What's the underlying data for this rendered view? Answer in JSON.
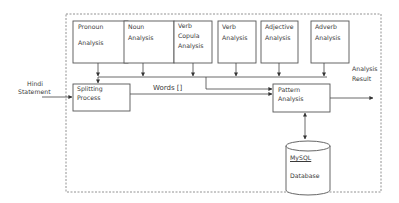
{
  "diagram": {
    "type": "block-flow",
    "container": {
      "style": "dashed",
      "label": ""
    },
    "input": {
      "label_line1": "Hindi",
      "label_line2": "Statement"
    },
    "output": {
      "label_line1": "Analysis",
      "label_line2": "Result"
    },
    "analysis_modules": [
      {
        "id": "pronoun",
        "line1": "Pronoun",
        "line2": "",
        "line3": "Analysis"
      },
      {
        "id": "noun",
        "line1": "Noun",
        "line2": "Analysis",
        "line3": ""
      },
      {
        "id": "verb_copula",
        "line1": "Verb",
        "line2": "Copula",
        "line3": "Analysis"
      },
      {
        "id": "verb",
        "line1": "Verb",
        "line2": "Analysis",
        "line3": ""
      },
      {
        "id": "adjective",
        "line1": "Adjective",
        "line2": "Analysis",
        "line3": ""
      },
      {
        "id": "adverb",
        "line1": "Adverb",
        "line2": "Analysis",
        "line3": ""
      }
    ],
    "splitting": {
      "line1": "Splitting",
      "line2": "Process"
    },
    "pattern": {
      "line1": "Pattern",
      "line2": "Analysis"
    },
    "edge_label_words": "Words []",
    "database": {
      "line1": "MySQL",
      "line2": "Database"
    },
    "edges": [
      {
        "from": "Hindi Statement",
        "to": "Splitting Process"
      },
      {
        "from": "Analysis modules",
        "to": "Splitting Process"
      },
      {
        "from": "Analysis modules",
        "to": "Pattern Analysis"
      },
      {
        "from": "Splitting Process",
        "to": "Pattern Analysis",
        "label": "Words []"
      },
      {
        "from": "Pattern Analysis",
        "to": "MySQL Database",
        "bidirectional": true
      },
      {
        "from": "Pattern Analysis",
        "to": "Analysis Result"
      }
    ]
  }
}
